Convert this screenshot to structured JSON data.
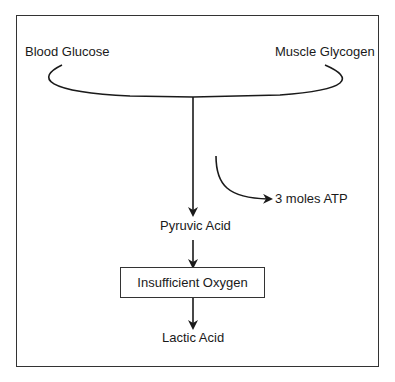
{
  "diagram": {
    "sources": {
      "left": "Blood Glucose",
      "right": "Muscle Glycogen"
    },
    "side_output": "3 moles ATP",
    "steps": [
      {
        "label": "Pyruvic Acid",
        "boxed": false
      },
      {
        "label": "Insufficient Oxygen",
        "boxed": true
      },
      {
        "label": "Lactic Acid",
        "boxed": false
      }
    ],
    "colors": {
      "line": "#1a1a1a",
      "background": "#ffffff"
    }
  }
}
